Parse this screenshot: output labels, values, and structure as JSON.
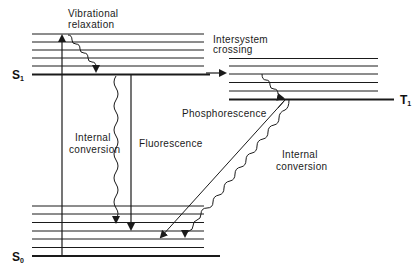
{
  "colors": {
    "line": "#1a1a1a",
    "background": "#ffffff"
  },
  "states": {
    "s1": {
      "label": "S",
      "subscript": "1"
    },
    "s0": {
      "label": "S",
      "subscript": "0"
    },
    "t1": {
      "label": "T",
      "subscript": "1"
    }
  },
  "labels": {
    "vibrational_relaxation_1": "Vibrational",
    "vibrational_relaxation_2": "relaxation",
    "intersystem_crossing_1": "Intersystem",
    "intersystem_crossing_2": "crossing",
    "internal_conversion_left_1": "Internal",
    "internal_conversion_left_2": "conversion",
    "fluorescence": "Fluorescence",
    "phosphorescence": "Phosphorescence",
    "internal_conversion_right_1": "Internal",
    "internal_conversion_right_2": "conversion"
  }
}
